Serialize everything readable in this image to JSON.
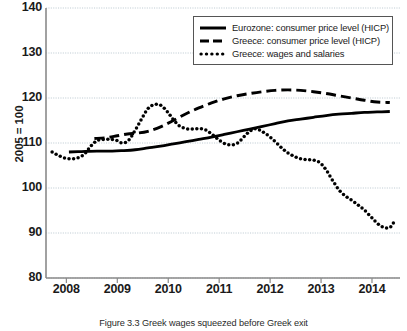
{
  "figure": {
    "caption": "Figure 3.3  Greek wages squeezed before Greek exit"
  },
  "chart_data": {
    "type": "line",
    "title": "",
    "xlabel": "",
    "ylabel": "2005 = 100",
    "xlim": [
      2007.6,
      2014.55
    ],
    "ylim": [
      80,
      140
    ],
    "yticks": [
      80,
      90,
      100,
      110,
      120,
      130,
      140
    ],
    "xticks": [
      2008,
      2009,
      2010,
      2011,
      2012,
      2013,
      2014
    ],
    "xtick_labels": [
      "2008",
      "2009",
      "2010",
      "2011",
      "2012",
      "2013",
      "2014"
    ],
    "ytick_labels": [
      "80",
      "90",
      "100",
      "110",
      "120",
      "130",
      "140"
    ],
    "grid": true,
    "grid_axis": "y",
    "legend_position": "top-right",
    "series": [
      {
        "name": "Eurozone: consumer price level (HICP)",
        "style": "solid",
        "color": "#000000",
        "x": [
          2008.05,
          2008.3,
          2008.6,
          2008.9,
          2009.1,
          2009.35,
          2009.6,
          2009.85,
          2010.1,
          2010.35,
          2010.6,
          2010.85,
          2011.1,
          2011.35,
          2011.6,
          2011.85,
          2012.1,
          2012.35,
          2012.6,
          2012.85,
          2013.1,
          2013.35,
          2013.6,
          2013.85,
          2014.1,
          2014.35
        ],
        "y": [
          108.0,
          108.1,
          108.2,
          108.2,
          108.3,
          108.5,
          108.9,
          109.3,
          109.8,
          110.3,
          110.8,
          111.3,
          111.9,
          112.5,
          113.1,
          113.7,
          114.3,
          114.9,
          115.3,
          115.7,
          116.1,
          116.4,
          116.6,
          116.8,
          116.9,
          117.0
        ]
      },
      {
        "name": "Greece: consumer price level (HICP)",
        "style": "dashed",
        "color": "#000000",
        "x": [
          2008.55,
          2008.8,
          2009.0,
          2009.2,
          2009.4,
          2009.6,
          2009.85,
          2010.1,
          2010.35,
          2010.6,
          2010.85,
          2011.1,
          2011.35,
          2011.6,
          2011.85,
          2012.1,
          2012.35,
          2012.6,
          2012.85,
          2013.1,
          2013.35,
          2013.6,
          2013.85,
          2014.1,
          2014.35
        ],
        "y": [
          111.0,
          111.2,
          111.6,
          112.0,
          112.2,
          112.6,
          113.6,
          115.0,
          116.5,
          117.8,
          118.9,
          119.8,
          120.5,
          121.0,
          121.4,
          121.7,
          121.8,
          121.7,
          121.4,
          121.0,
          120.5,
          120.0,
          119.5,
          119.1,
          119.0
        ]
      },
      {
        "name": "Greece: wages and salaries",
        "style": "dotted",
        "color": "#000000",
        "x": [
          2007.72,
          2007.85,
          2007.98,
          2008.1,
          2008.22,
          2008.35,
          2008.48,
          2008.6,
          2008.72,
          2008.85,
          2008.98,
          2009.1,
          2009.22,
          2009.35,
          2009.48,
          2009.6,
          2009.72,
          2009.85,
          2009.98,
          2010.1,
          2010.22,
          2010.35,
          2010.48,
          2010.6,
          2010.72,
          2010.85,
          2010.98,
          2011.1,
          2011.22,
          2011.35,
          2011.48,
          2011.6,
          2011.72,
          2011.85,
          2011.98,
          2012.1,
          2012.22,
          2012.35,
          2012.48,
          2012.6,
          2012.72,
          2012.85,
          2012.98,
          2013.1,
          2013.22,
          2013.35,
          2013.48,
          2013.6,
          2013.72,
          2013.85,
          2013.98,
          2014.1,
          2014.22,
          2014.35,
          2014.45
        ],
        "y": [
          108.0,
          107.2,
          106.6,
          106.5,
          106.7,
          107.5,
          109.3,
          110.5,
          110.8,
          110.8,
          110.6,
          110.0,
          110.6,
          112.8,
          115.4,
          117.6,
          118.5,
          118.4,
          117.0,
          115.2,
          113.8,
          113.2,
          113.1,
          113.2,
          113.0,
          112.0,
          110.8,
          109.9,
          109.6,
          109.9,
          111.3,
          112.6,
          113.2,
          112.5,
          111.5,
          110.3,
          109.0,
          107.8,
          107.0,
          106.5,
          106.3,
          106.2,
          105.6,
          104.0,
          101.8,
          99.6,
          98.2,
          97.3,
          96.3,
          95.1,
          93.6,
          92.2,
          91.3,
          91.2,
          92.8
        ]
      }
    ]
  },
  "legend": {
    "items": [
      {
        "label": "Eurozone: consumer price level (HICP)",
        "style": "solid"
      },
      {
        "label": "Greece: consumer price level (HICP)",
        "style": "dashed"
      },
      {
        "label": "Greece: wages and salaries",
        "style": "dotted"
      }
    ]
  },
  "colors": {
    "axis": "#8a8a8a",
    "grid": "#b9c6cf",
    "line": "#000000",
    "text": "#1a1a1a"
  }
}
